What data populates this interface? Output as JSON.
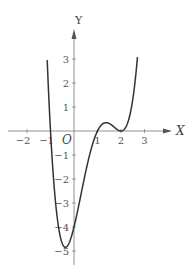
{
  "chart_data": {
    "type": "line",
    "title": "",
    "xlabel": "X",
    "ylabel": "Y",
    "origin_label": "O",
    "x_ticks": [
      -2,
      -1,
      1,
      2,
      3
    ],
    "x_tick_labels": [
      "−2",
      "−1",
      "1",
      "2",
      "3"
    ],
    "y_ticks": [
      3,
      2,
      1,
      -1,
      -2,
      -3,
      -4,
      -5
    ],
    "y_tick_labels": [
      "3",
      "2",
      "1",
      "−1",
      "−2",
      "−3",
      "−4",
      "−5"
    ],
    "xlim": [
      -2.5,
      3.6
    ],
    "ylim": [
      -5.4,
      4.2
    ],
    "grid": false,
    "series": [
      {
        "name": "f(x)",
        "x": [
          -1.14,
          -1.0,
          -0.8,
          -0.5,
          -0.2,
          0.0,
          0.3,
          0.6,
          1.0,
          1.2,
          1.4,
          1.6,
          1.8,
          2.0,
          2.2,
          2.4,
          2.6,
          2.7
        ],
        "values": [
          2.95,
          0.0,
          -2.63,
          -4.69,
          -4.63,
          -4.0,
          -2.64,
          -1.25,
          0.0,
          0.28,
          0.35,
          0.25,
          0.09,
          0.0,
          0.15,
          0.76,
          2.06,
          3.08
        ]
      }
    ],
    "key_points": {
      "x_intercepts": [
        -1,
        1,
        2
      ],
      "y_intercept": -4,
      "local_min": [
        -0.5,
        -4.7
      ],
      "local_max": [
        1.4,
        0.35
      ],
      "tangent_min": [
        2,
        0
      ]
    }
  }
}
